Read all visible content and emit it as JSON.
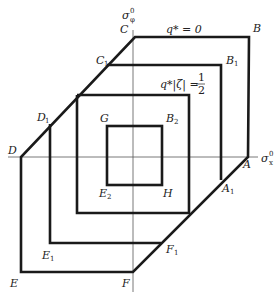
{
  "diagram": {
    "type": "yield-surface-diagram",
    "axes": {
      "horizontal": {
        "label": "σ",
        "sup": "0",
        "sub": "x"
      },
      "vertical": {
        "label": "σ",
        "sup": "0",
        "sub": "φ"
      }
    },
    "annotations": {
      "q0": "q* = 0",
      "q_half_left": "q*|ζ| = ",
      "q_half_num": "1",
      "q_half_den": "2"
    },
    "points": {
      "A": "A",
      "A1_main": "A",
      "A1_sub": "1",
      "B": "B",
      "B1_main": "B",
      "B1_sub": "1",
      "B2_main": "B",
      "B2_sub": "2",
      "C": "C",
      "C1_main": "C",
      "C1_sub": "1",
      "D": "D",
      "D1_main": "D",
      "D1_sub": "1",
      "E": "E",
      "E1_main": "E",
      "E1_sub": "1",
      "E2_main": "E",
      "E2_sub": "2",
      "F": "F",
      "F1_main": "F",
      "F1_sub": "1",
      "G": "G",
      "H": "H"
    },
    "colors": {
      "line": "#1a1a1a",
      "axis": "#555555",
      "background": "#ffffff"
    }
  }
}
